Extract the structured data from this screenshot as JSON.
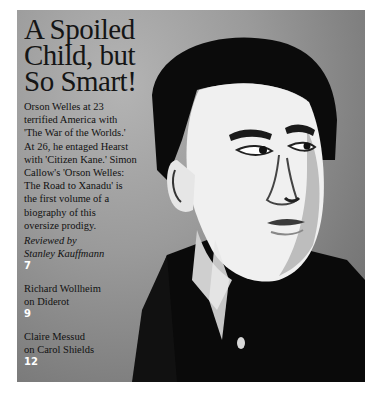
{
  "feature": {
    "headline_lines": [
      "A Spoiled",
      "Child, but",
      "So Smart!"
    ],
    "blurb_lines": [
      "Orson Welles at 23",
      "terrified America with",
      "'The War of the Worlds.'",
      "At 26, he entaged Hearst",
      "with 'Citizen Kane.' Simon",
      "Callow's 'Orson Welles:",
      "The Road to Xanadu' is",
      "the first volume of a",
      "biography of this",
      "oversize prodigy."
    ],
    "byline_lines": [
      "Reviewed by",
      "Stanley Kauffmann"
    ],
    "page": "7"
  },
  "contents": [
    {
      "lines": [
        "Richard Wollheim",
        "on Diderot"
      ],
      "page": "9"
    },
    {
      "lines": [
        "Claire Messud",
        "on Carol Shields"
      ],
      "page": "12"
    }
  ],
  "image": {
    "subject": "portrait-orson-welles",
    "palette": {
      "dark": "#0a0a0a",
      "light": "#f2f2f2",
      "background": "#9a9a9a"
    }
  }
}
